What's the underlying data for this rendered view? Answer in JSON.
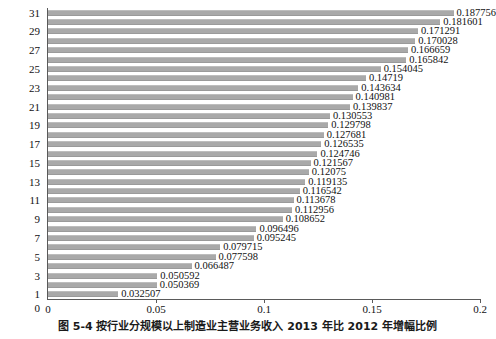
{
  "chart_data": {
    "type": "bar",
    "orientation": "horizontal",
    "title": "",
    "subtitle": "",
    "xlabel": "",
    "ylabel": "",
    "xlim": [
      0,
      0.2
    ],
    "x_ticks": [
      "0",
      "0.05",
      "0.1",
      "0.15",
      "0.2"
    ],
    "x_tick_values": [
      0,
      0.05,
      0.1,
      0.15,
      0.2
    ],
    "y_ticks": [
      "1",
      "3",
      "5",
      "7",
      "9",
      "11",
      "13",
      "15",
      "17",
      "19",
      "21",
      "23",
      "25",
      "27",
      "29",
      "31"
    ],
    "y_tick_values": [
      1,
      3,
      5,
      7,
      9,
      11,
      13,
      15,
      17,
      19,
      21,
      23,
      25,
      27,
      29,
      31
    ],
    "grid": false,
    "legend": "none",
    "bar_color": "#a9a9a9",
    "categories": [
      1,
      2,
      3,
      4,
      5,
      6,
      7,
      8,
      9,
      10,
      11,
      12,
      13,
      14,
      15,
      16,
      17,
      18,
      19,
      20,
      21,
      22,
      23,
      24,
      25,
      26,
      27,
      28,
      29,
      30,
      31
    ],
    "values": [
      0.032507,
      0.050369,
      0.050592,
      0.066487,
      0.077598,
      0.079715,
      0.095245,
      0.096496,
      0.108652,
      0.112956,
      0.113678,
      0.116542,
      0.119135,
      0.12075,
      0.121567,
      0.124746,
      0.126535,
      0.127681,
      0.129798,
      0.130553,
      0.139837,
      0.140981,
      0.143634,
      0.14719,
      0.154045,
      0.165842,
      0.166659,
      0.170028,
      0.171291,
      0.181601,
      0.187756
    ],
    "data_labels": [
      "0.032507",
      "0.050369",
      "0.050592",
      "0.066487",
      "0.077598",
      "0.079715",
      "0.095245",
      "0.096496",
      "0.108652",
      "0.112956",
      "0.113678",
      "0.116542",
      "0.119135",
      "0.12075",
      "0.121567",
      "0.124746",
      "0.126535",
      "0.127681",
      "0.129798",
      "0.130553",
      "0.139837",
      "0.140981",
      "0.143634",
      "0.14719",
      "0.154045",
      "0.165842",
      "0.166659",
      "0.170028",
      "0.171291",
      "0.181601",
      "0.187756"
    ]
  },
  "caption": {
    "text": "图 5-4  按行业分规模以上制造业主营业务收入 2013 年比 2012 年增幅比例"
  }
}
